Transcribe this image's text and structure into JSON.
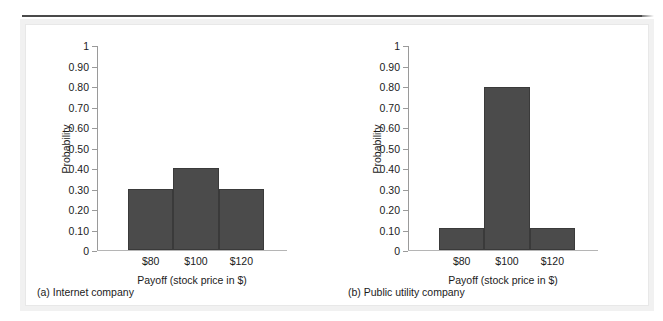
{
  "figure": {
    "background_color": "#ffffff",
    "panel_color": "#ffffff",
    "rule_color": "#4a4a4a",
    "bar_color": "#4b4b4b"
  },
  "chart_data": [
    {
      "type": "bar",
      "panel_letter": "(a)",
      "caption": "(a) Internet company",
      "title": "",
      "xlabel": "Payoff (stock price in $)",
      "ylabel": "Probability",
      "categories": [
        "$80",
        "$100",
        "$120"
      ],
      "values": [
        0.3,
        0.4,
        0.3
      ],
      "ylim": [
        0,
        1
      ],
      "ytick_labels": [
        "1",
        "0.90",
        "0.80",
        "0.70",
        "0.60",
        "0.50",
        "0.40",
        "0.30",
        "0.20",
        "0.10",
        "0"
      ],
      "ytick_values": [
        1,
        0.9,
        0.8,
        0.7,
        0.6,
        0.5,
        0.4,
        0.3,
        0.2,
        0.1,
        0
      ],
      "grid": false,
      "legend": false,
      "bar_color": "#4b4b4b"
    },
    {
      "type": "bar",
      "panel_letter": "(b)",
      "caption": "(b) Public utility company",
      "title": "",
      "xlabel": "Payoff (stock price in $)",
      "ylabel": "Probability",
      "categories": [
        "$80",
        "$100",
        "$120"
      ],
      "values": [
        0.11,
        0.8,
        0.11
      ],
      "ylim": [
        0,
        1
      ],
      "ytick_labels": [
        "1",
        "0.90",
        "0.80",
        "0.70",
        "0.60",
        "0.50",
        "0.40",
        "0.30",
        "0.20",
        "0.10",
        "0"
      ],
      "ytick_values": [
        1,
        0.9,
        0.8,
        0.7,
        0.6,
        0.5,
        0.4,
        0.3,
        0.2,
        0.1,
        0
      ],
      "grid": false,
      "legend": false,
      "bar_color": "#4b4b4b"
    }
  ]
}
